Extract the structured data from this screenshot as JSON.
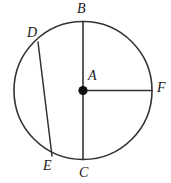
{
  "figure": {
    "type": "circle-geometry-diagram",
    "background_color": "#ffffff",
    "stroke_color": "#333333",
    "label_color": "#1a1a1a",
    "labels": {
      "b": "B",
      "d": "D",
      "a": "A",
      "f": "F",
      "e": "E",
      "c": "C"
    },
    "elements": {
      "circle_name": "circle-outline",
      "center_dot_name": "center-point-a",
      "diameter_name": "diameter-bc",
      "radius_name": "radius-af",
      "chord_name": "chord-de"
    },
    "geometry": {
      "circle": {
        "cx": 83,
        "cy": 90.5,
        "r": 69
      },
      "points": {
        "A": {
          "x": 83,
          "y": 90.5
        },
        "B": {
          "x": 83,
          "y": 21.5
        },
        "C": {
          "x": 83,
          "y": 159.5
        },
        "D": {
          "x": 38,
          "y": 42
        },
        "E": {
          "x": 52,
          "y": 156
        },
        "F": {
          "x": 152,
          "y": 90.5
        }
      },
      "segments": [
        {
          "name": "diameter-bc",
          "from": "B",
          "to": "C"
        },
        {
          "name": "radius-af",
          "from": "A",
          "to": "F"
        },
        {
          "name": "chord-de",
          "from": "D",
          "to": "E"
        }
      ]
    }
  }
}
